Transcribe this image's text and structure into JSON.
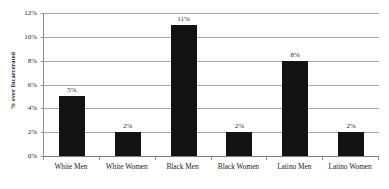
{
  "chart_data": {
    "type": "bar",
    "title": "",
    "xlabel": "",
    "ylabel": "% ever Incarcerated",
    "categories": [
      "White Men",
      "White Women",
      "Black Men",
      "Black Women",
      "Latino Men",
      "Latino Women"
    ],
    "values": [
      5,
      2,
      11,
      2,
      8,
      2
    ],
    "data_labels": [
      "5%",
      "2%",
      "11%",
      "2%",
      "8%",
      "2%"
    ],
    "ylim": [
      0,
      12
    ],
    "ytick_values": [
      0,
      2,
      4,
      6,
      8,
      10,
      12
    ],
    "ytick_labels": [
      "0%",
      "2%",
      "4%",
      "6%",
      "8%",
      "10%",
      "12%"
    ],
    "grid": true,
    "legend": false,
    "legend_position": "none",
    "bar_color": "#131313",
    "gridline_color": "#a6a6a6",
    "axis_color": "#7a7a7a"
  }
}
